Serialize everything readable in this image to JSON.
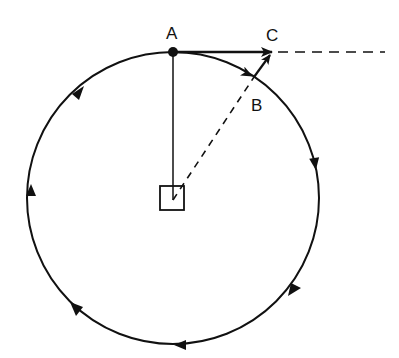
{
  "diagram": {
    "type": "circular-motion-vector-diagram",
    "colors": {
      "ink": "#111111",
      "background": "#ffffff"
    },
    "circle": {
      "cx": 173,
      "cy": 198,
      "r": 146,
      "direction": "clockwise"
    },
    "center_marker": {
      "shape": "square",
      "x": 160,
      "y": 186,
      "size": 24
    },
    "points": [
      {
        "id": "A",
        "label": "A",
        "x": 173,
        "y": 52,
        "label_x": 166,
        "label_y": 39
      },
      {
        "id": "B",
        "label": "B",
        "x": 254,
        "y": 77,
        "label_x": 251,
        "label_y": 111
      },
      {
        "id": "C",
        "label": "C",
        "x": 272,
        "y": 52,
        "label_x": 266,
        "label_y": 41
      }
    ],
    "vectors": [
      {
        "name": "velocity-at-A",
        "from": "A",
        "to": "C",
        "style": "solid-arrow"
      },
      {
        "name": "change-in-velocity",
        "from": "B",
        "to": "C",
        "style": "solid-arrow"
      },
      {
        "name": "arc-arrow-to-B",
        "style": "arrowhead-on-circle"
      }
    ],
    "lines": [
      {
        "name": "radius-to-A",
        "from": "center",
        "to": "A",
        "style": "solid"
      },
      {
        "name": "radius-to-B",
        "from": "center",
        "to": "B",
        "style": "dashed"
      },
      {
        "name": "tangent-extension",
        "from": "C",
        "to_x": 385,
        "style": "dashed"
      }
    ],
    "direction_arrows_on_circle": 7
  }
}
